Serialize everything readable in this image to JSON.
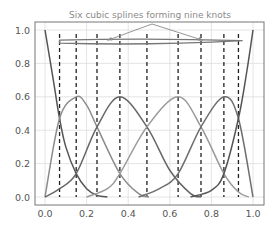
{
  "chart_data": {
    "type": "line",
    "title": "Six cubic splines forming nine knots",
    "xlabel": "",
    "ylabel": "",
    "xlim": [
      -0.05,
      1.05
    ],
    "ylim": [
      -0.05,
      1.05
    ],
    "grid": true,
    "x_ticks": [
      0.0,
      0.2,
      0.4,
      0.6,
      0.8,
      1.0
    ],
    "x_tick_labels": [
      "0.0",
      "0.2",
      "0.4",
      "0.6",
      "0.8",
      "1.0"
    ],
    "y_ticks": [
      0.0,
      0.2,
      0.4,
      0.6,
      0.8,
      1.0
    ],
    "y_tick_labels": [
      "0.0",
      "0.2",
      "0.4",
      "0.6",
      "0.8",
      "1.0"
    ],
    "knots": [
      0.07,
      0.15,
      0.25,
      0.36,
      0.49,
      0.64,
      0.75,
      0.86,
      0.93
    ],
    "series": [
      {
        "name": "spline-left-edge",
        "color": "#555555",
        "points": [
          [
            0.0,
            1.0
          ],
          [
            0.04,
            0.7
          ],
          [
            0.07,
            0.47
          ],
          [
            0.1,
            0.3
          ],
          [
            0.15,
            0.14
          ],
          [
            0.2,
            0.05
          ],
          [
            0.25,
            0.01
          ],
          [
            0.3,
            0.0
          ]
        ]
      },
      {
        "name": "spline-1",
        "color": "#8c8c8c",
        "points": [
          [
            0.0,
            0.0
          ],
          [
            0.07,
            0.47
          ],
          [
            0.15,
            0.6
          ],
          [
            0.2,
            0.55
          ],
          [
            0.25,
            0.42
          ],
          [
            0.36,
            0.14
          ],
          [
            0.45,
            0.02
          ],
          [
            0.5,
            0.0
          ]
        ]
      },
      {
        "name": "spline-2",
        "color": "#666666",
        "points": [
          [
            0.0,
            0.0
          ],
          [
            0.07,
            0.05
          ],
          [
            0.15,
            0.14
          ],
          [
            0.25,
            0.42
          ],
          [
            0.36,
            0.6
          ],
          [
            0.49,
            0.42
          ],
          [
            0.6,
            0.16
          ],
          [
            0.7,
            0.02
          ],
          [
            0.75,
            0.0
          ]
        ]
      },
      {
        "name": "spline-3",
        "color": "#999999",
        "points": [
          [
            0.2,
            0.0
          ],
          [
            0.3,
            0.05
          ],
          [
            0.36,
            0.14
          ],
          [
            0.49,
            0.42
          ],
          [
            0.64,
            0.6
          ],
          [
            0.75,
            0.42
          ],
          [
            0.86,
            0.14
          ],
          [
            0.93,
            0.03
          ],
          [
            0.98,
            0.0
          ]
        ]
      },
      {
        "name": "spline-4",
        "color": "#6e6e6e",
        "points": [
          [
            0.45,
            0.0
          ],
          [
            0.55,
            0.05
          ],
          [
            0.64,
            0.14
          ],
          [
            0.75,
            0.42
          ],
          [
            0.86,
            0.6
          ],
          [
            0.93,
            0.47
          ],
          [
            1.0,
            0.0
          ]
        ]
      },
      {
        "name": "spline-right-edge",
        "color": "#555555",
        "points": [
          [
            0.7,
            0.0
          ],
          [
            0.8,
            0.04
          ],
          [
            0.86,
            0.14
          ],
          [
            0.93,
            0.47
          ],
          [
            0.97,
            0.75
          ],
          [
            1.0,
            1.0
          ]
        ]
      }
    ],
    "annotation": {
      "text": "Six cubic splines forming nine knots",
      "bar_y": 0.93,
      "bar_x": [
        0.07,
        0.95
      ],
      "arrow_targets": [
        [
          0.3,
          0.95
        ],
        [
          0.76,
          0.95
        ]
      ],
      "arrow_origin": [
        0.5,
        1.03
      ]
    }
  }
}
